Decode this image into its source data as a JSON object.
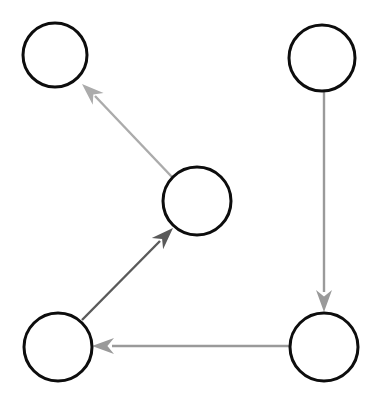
{
  "figure": {
    "kind": "directed-graph-diagram",
    "width": 377,
    "height": 407,
    "background_color": "#ffffff",
    "title": ""
  },
  "style": {
    "node_stroke_color": "#0d0d0d",
    "node_fill_color": "#ffffff",
    "node_stroke_width": 3,
    "edge_light_color": "#ababab",
    "edge_medium_color": "#9a9a9a",
    "edge_dark_color": "#5a5a5a",
    "edge_width": 2.4
  },
  "nodes": [
    {
      "id": "node-top-left",
      "label": "",
      "cx": 55,
      "cy": 55,
      "r": 32,
      "stroke": "#0d0d0d",
      "fill": "#ffffff"
    },
    {
      "id": "node-top-right",
      "label": "",
      "cx": 322,
      "cy": 58,
      "r": 33,
      "stroke": "#0d0d0d",
      "fill": "#ffffff"
    },
    {
      "id": "node-center",
      "label": "",
      "cx": 197,
      "cy": 201,
      "r": 34,
      "stroke": "#0d0d0d",
      "fill": "#ffffff"
    },
    {
      "id": "node-bottom-left",
      "label": "",
      "cx": 58,
      "cy": 347,
      "r": 34,
      "stroke": "#0d0d0d",
      "fill": "#ffffff"
    },
    {
      "id": "node-bottom-right",
      "label": "",
      "cx": 324,
      "cy": 347,
      "r": 34,
      "stroke": "#0d0d0d",
      "fill": "#ffffff"
    }
  ],
  "edges": [
    {
      "id": "edge-center-to-top-left",
      "label": "",
      "from": "node-center",
      "to": "node-top-left",
      "color": "#ababab",
      "width": 2.4,
      "line": {
        "x1": 172,
        "y1": 177,
        "x2": 95,
        "y2": 96
      },
      "head": {
        "tip_x": 82,
        "tip_y": 84,
        "length": 22,
        "half_width": 8
      }
    },
    {
      "id": "edge-bottom-left-to-center",
      "label": "",
      "from": "node-bottom-left",
      "to": "node-center",
      "color": "#5a5a5a",
      "width": 2.4,
      "line": {
        "x1": 82,
        "y1": 320,
        "x2": 160,
        "y2": 241
      },
      "head": {
        "tip_x": 173,
        "tip_y": 228,
        "length": 22,
        "half_width": 8
      }
    },
    {
      "id": "edge-top-right-to-bottom-right",
      "label": "",
      "from": "node-top-right",
      "to": "node-bottom-right",
      "color": "#9a9a9a",
      "width": 2.4,
      "line": {
        "x1": 324,
        "y1": 92,
        "x2": 324,
        "y2": 292
      },
      "head": {
        "tip_x": 324,
        "tip_y": 312,
        "length": 22,
        "half_width": 8
      }
    },
    {
      "id": "edge-bottom-right-to-bottom-left",
      "label": "",
      "from": "node-bottom-right",
      "to": "node-bottom-left",
      "color": "#9a9a9a",
      "width": 2.4,
      "line": {
        "x1": 292,
        "y1": 346,
        "x2": 112,
        "y2": 346
      },
      "head": {
        "tip_x": 92,
        "tip_y": 346,
        "length": 22,
        "half_width": 8
      }
    }
  ]
}
